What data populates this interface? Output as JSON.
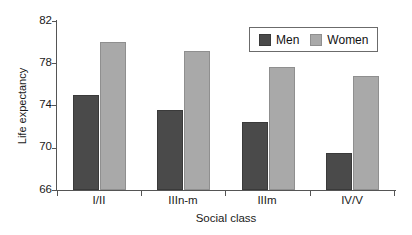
{
  "chart_data": {
    "type": "bar",
    "title": "",
    "xlabel": "Social class",
    "ylabel": "Life expectancy",
    "categories": [
      "I/II",
      "IIIn-m",
      "IIIm",
      "IV/V"
    ],
    "series": [
      {
        "name": "Men",
        "color": "#4a4a4a",
        "values": [
          75.0,
          73.6,
          72.4,
          69.5
        ]
      },
      {
        "name": "Women",
        "color": "#a9a9a9",
        "values": [
          80.0,
          79.2,
          77.6,
          76.8
        ]
      }
    ],
    "ylim": [
      66,
      82
    ],
    "yticks": [
      66,
      70,
      74,
      78,
      82
    ],
    "grid": false,
    "legend_position": "top-right"
  },
  "axes": {
    "y_tick_labels": [
      "82",
      "78",
      "74",
      "70",
      "66"
    ],
    "x_tick_labels": [
      "I/II",
      "IIIn-m",
      "IIIm",
      "IV/V"
    ],
    "y_axis_title": "Life expectancy",
    "x_axis_title": "Social class"
  },
  "legend": {
    "entries": [
      {
        "label": "Men",
        "swatch": "men-swatch"
      },
      {
        "label": "Women",
        "swatch": "women-swatch"
      }
    ]
  }
}
